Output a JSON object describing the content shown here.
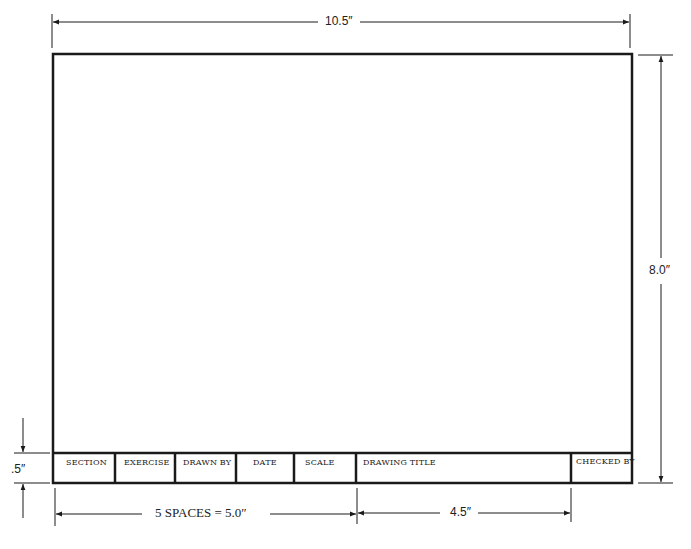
{
  "diagram": {
    "dimensions": {
      "width": "10.5″",
      "height": "8.0″",
      "title_block_height": ".5″",
      "spaces": "5 SPACES  =  5.0″",
      "drawing_title_width": "4.5″"
    },
    "title_block": {
      "cells": [
        {
          "label": "SECTION"
        },
        {
          "label": "EXERCISE"
        },
        {
          "label": "DRAWN BY"
        },
        {
          "label": "DATE"
        },
        {
          "label": "SCALE"
        },
        {
          "label": "DRAWING TITLE"
        },
        {
          "label": "CHECKED BY"
        }
      ]
    },
    "colors": {
      "line": "#1a1a1a",
      "background": "#ffffff"
    }
  }
}
